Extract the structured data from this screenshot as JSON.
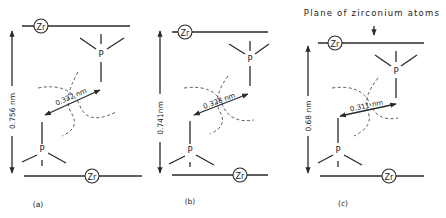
{
  "title": "Plane of zirconium atoms",
  "atom_labels": {
    "zirconium": "Zr",
    "phosphorus": "P"
  },
  "panels": [
    {
      "id": "a",
      "label": "(a)",
      "interlayer_distance": "0.756 nm",
      "p_p_distance": "0.332 nm"
    },
    {
      "id": "b",
      "label": "(b)",
      "interlayer_distance": "0.741nm",
      "p_p_distance": "0.328 nm"
    },
    {
      "id": "c",
      "label": "(c)",
      "interlayer_distance": "0.68 nm",
      "p_p_distance": "0.311 nm"
    }
  ],
  "colors": {
    "line": "#2a2a2a",
    "background": "#ffffff"
  }
}
